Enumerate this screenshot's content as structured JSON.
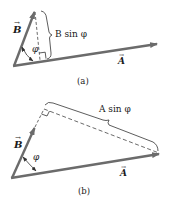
{
  "figure": {
    "colors": {
      "vector": "#6b6b6b",
      "line": "#3a3a3a",
      "text": "#1a1a1a",
      "background": "#ffffff"
    },
    "panel_a": {
      "caption": "(a)",
      "vector_a_label": "A",
      "vector_b_label": "B",
      "angle_label": "φ",
      "component_label": "B sin φ"
    },
    "panel_b": {
      "caption": "(b)",
      "vector_a_label": "A",
      "vector_b_label": "B",
      "angle_label": "φ",
      "component_label": "A sin φ"
    }
  }
}
